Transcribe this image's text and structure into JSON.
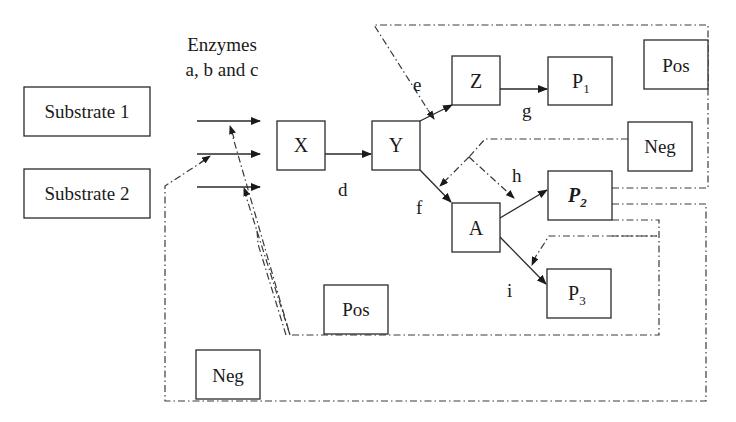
{
  "diagram": {
    "enzymes_label_line1": "Enzymes",
    "enzymes_label_line2": "a, b and c",
    "nodes": {
      "substrate1": "Substrate 1",
      "substrate2": "Substrate 2",
      "x": "X",
      "y": "Y",
      "z": "Z",
      "a": "A",
      "p1": {
        "base": "P",
        "sub": "1"
      },
      "p2": {
        "base": "P",
        "sub": "2"
      },
      "p3": {
        "base": "P",
        "sub": "3"
      },
      "pos_top": "Pos",
      "neg_right": "Neg",
      "pos_bottom": "Pos",
      "neg_bottom": "Neg"
    },
    "edge_labels": {
      "d": "d",
      "e": "e",
      "f": "f",
      "g": "g",
      "h": "h",
      "i": "i"
    },
    "edges": [
      {
        "from": "enzymes",
        "to": "X",
        "style": "solid"
      },
      {
        "from": "X",
        "to": "Y",
        "label": "d",
        "style": "solid"
      },
      {
        "from": "Y",
        "to": "Z",
        "label": "e",
        "style": "solid"
      },
      {
        "from": "Y",
        "to": "A",
        "label": "f",
        "style": "solid"
      },
      {
        "from": "Z",
        "to": "P1",
        "label": "g",
        "style": "solid"
      },
      {
        "from": "A",
        "to": "P2",
        "label": "h",
        "style": "solid"
      },
      {
        "from": "A",
        "to": "P3",
        "label": "i",
        "style": "solid"
      },
      {
        "from": "P2",
        "to": "e",
        "via": "Pos",
        "style": "dash-dot"
      },
      {
        "from": "P2",
        "to": "f,h",
        "via": "Neg",
        "style": "dash-dot"
      },
      {
        "from": "P2",
        "to": "enzymes",
        "via": "Pos",
        "style": "dash-dot"
      },
      {
        "from": "P2",
        "to": "enzymes",
        "via": "Neg",
        "style": "dash-dot"
      },
      {
        "from": "P2",
        "to": "i",
        "style": "dash-dot"
      }
    ]
  }
}
